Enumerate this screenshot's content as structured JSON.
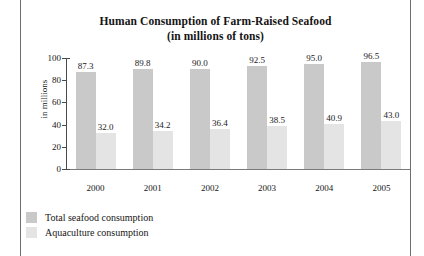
{
  "chart_data": {
    "type": "bar",
    "title": "Human Consumption of Farm-Raised Seafood",
    "subtitle": "(in millions of tons)",
    "xlabel": "",
    "ylabel": "in millions",
    "ylim": [
      0,
      100
    ],
    "ytick_step": 20,
    "yticks": [
      "0",
      "20",
      "40",
      "60",
      "80",
      "100"
    ],
    "grid": false,
    "legend_position": "bottom-left",
    "categories": [
      "2000",
      "2001",
      "2002",
      "2003",
      "2004",
      "2005"
    ],
    "series": [
      {
        "name": "Total seafood consumption",
        "color": "#c9c9c9",
        "values": [
          87.3,
          89.8,
          90.0,
          92.5,
          95.0,
          96.5
        ],
        "labels": [
          "87.3",
          "89.8",
          "90.0",
          "92.5",
          "95.0",
          "96.5"
        ]
      },
      {
        "name": "Aquaculture consumption",
        "color": "#e4e4e4",
        "values": [
          32.0,
          34.2,
          36.4,
          38.5,
          40.9,
          43.0
        ],
        "labels": [
          "32.0",
          "34.2",
          "36.4",
          "38.5",
          "40.9",
          "43.0"
        ]
      }
    ]
  },
  "legend": {
    "items": [
      {
        "label": "Total seafood consumption",
        "color": "#c9c9c9"
      },
      {
        "label": "Aquaculture consumption",
        "color": "#e4e4e4"
      }
    ]
  }
}
